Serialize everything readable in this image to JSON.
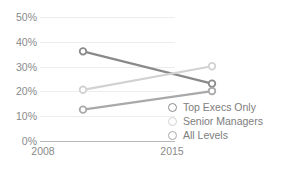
{
  "chart_data": {
    "type": "line",
    "title": "",
    "subtitle": "",
    "xlabel": "",
    "ylabel": "",
    "categories": [
      "2008",
      "2015"
    ],
    "x": [
      2008,
      2015
    ],
    "ylim": [
      0,
      50
    ],
    "yticks": [
      {
        "value": 50,
        "label": "50%"
      },
      {
        "value": 40,
        "label": "40%"
      },
      {
        "value": 30,
        "label": "30%"
      },
      {
        "value": 20,
        "label": "20%"
      },
      {
        "value": 10,
        "label": "10%"
      },
      {
        "value": 0,
        "label": "0%"
      }
    ],
    "ytick_suffix": "%",
    "grid": true,
    "grid_color": "#ededed",
    "axis_color": "#b9b9b9",
    "legend_position": "bottom-right-inside",
    "marker": "open-circle",
    "series": [
      {
        "name": "Top Execs Only",
        "color": "#8a8a8a",
        "values": [
          43,
          30
        ]
      },
      {
        "name": "Senior Managers",
        "color": "#d2d2d2",
        "values": [
          27.5,
          37
        ]
      },
      {
        "name": "All Levels",
        "color": "#a9a9a9",
        "values": [
          19.5,
          27
        ]
      }
    ]
  },
  "legend": {
    "items": [
      {
        "label": "Top Execs Only",
        "color": "#8a8a8a"
      },
      {
        "label": "Senior Managers",
        "color": "#d2d2d2"
      },
      {
        "label": "All Levels",
        "color": "#a9a9a9"
      }
    ]
  }
}
